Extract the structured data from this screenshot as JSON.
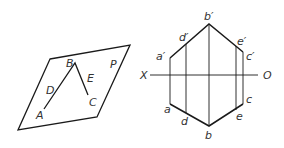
{
  "diagram": {
    "left_figure": {
      "plane_label": "P",
      "points": [
        {
          "id": "A",
          "label": "A",
          "x": 44,
          "y": 109,
          "lx": 36,
          "ly": 118
        },
        {
          "id": "B",
          "label": "B",
          "x": 75,
          "y": 63,
          "lx": 66,
          "ly": 64
        },
        {
          "id": "C",
          "label": "C",
          "x": 88,
          "y": 95,
          "lx": 89,
          "ly": 105
        },
        {
          "id": "D",
          "label": "D",
          "x": 57,
          "y": 90,
          "lx": 46,
          "ly": 93
        },
        {
          "id": "E",
          "label": "E",
          "x": 83,
          "y": 80,
          "lx": 88,
          "ly": 81
        }
      ],
      "plane_corners": [
        [
          50,
          59
        ],
        [
          130,
          45
        ],
        [
          97,
          117
        ],
        [
          18,
          130
        ]
      ]
    },
    "right_figure": {
      "axis": {
        "left_label": "X",
        "right_label": "O",
        "y": 75,
        "x1": 150,
        "x2": 258
      },
      "top_view": [
        {
          "id": "a1",
          "label": "a′",
          "x": 170,
          "y": 58
        },
        {
          "id": "d1",
          "label": "d′",
          "x": 186,
          "y": 44
        },
        {
          "id": "b1",
          "label": "b′",
          "x": 209,
          "y": 24
        },
        {
          "id": "e1",
          "label": "e′",
          "x": 236,
          "y": 46
        },
        {
          "id": "c1",
          "label": "c′",
          "x": 243,
          "y": 52
        }
      ],
      "bottom_view": [
        {
          "id": "a",
          "label": "a",
          "x": 170,
          "y": 104
        },
        {
          "id": "d",
          "label": "d",
          "x": 186,
          "y": 113
        },
        {
          "id": "b",
          "label": "b",
          "x": 209,
          "y": 126
        },
        {
          "id": "e",
          "label": "e",
          "x": 236,
          "y": 110
        },
        {
          "id": "c",
          "label": "c",
          "x": 243,
          "y": 104
        }
      ]
    }
  }
}
